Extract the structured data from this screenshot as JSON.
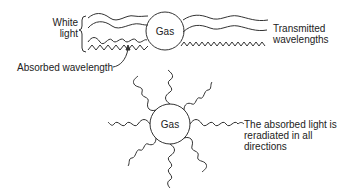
{
  "diagram": {
    "top": {
      "gas_label": "Gas",
      "white_light_label": "White\nlight",
      "white_light_line1": "White",
      "white_light_line2": "light",
      "absorbed_label": "Absorbed wavelength",
      "transmitted_line1": "Transmitted",
      "transmitted_line2": "wavelengths"
    },
    "bottom": {
      "gas_label": "Gas",
      "reradiated_line1": "The absorbed light is",
      "reradiated_line2": "reradiated in all",
      "reradiated_line3": "directions"
    },
    "colors": {
      "stroke": "#333333",
      "text": "#222222",
      "background": "#ffffff"
    }
  }
}
